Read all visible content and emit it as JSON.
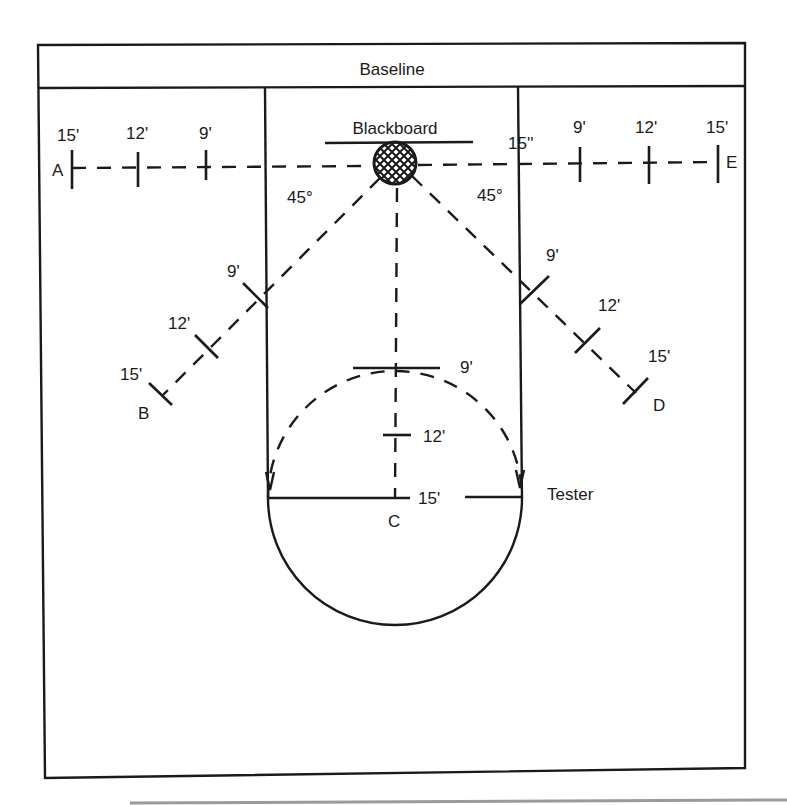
{
  "diagram": {
    "baseline_label": "Baseline",
    "blackboard_label": "Blackboard",
    "tester_label": "Tester",
    "angle_left": "45°",
    "angle_right": "45°",
    "spots": {
      "A": {
        "label": "A",
        "marks": [
          "15'",
          "12'",
          "9'"
        ]
      },
      "B": {
        "label": "B",
        "marks": [
          "9'",
          "12'",
          "15'"
        ]
      },
      "C": {
        "label": "C",
        "marks": [
          "9'",
          "12'",
          "15'"
        ]
      },
      "D": {
        "label": "D",
        "marks": [
          "9'",
          "12'",
          "15'"
        ]
      },
      "E": {
        "label": "E",
        "marks": [
          "15''",
          "9'",
          "12'",
          "15'"
        ]
      }
    }
  },
  "colors": {
    "ink": "#1a1a1a",
    "paper": "#ffffff"
  }
}
